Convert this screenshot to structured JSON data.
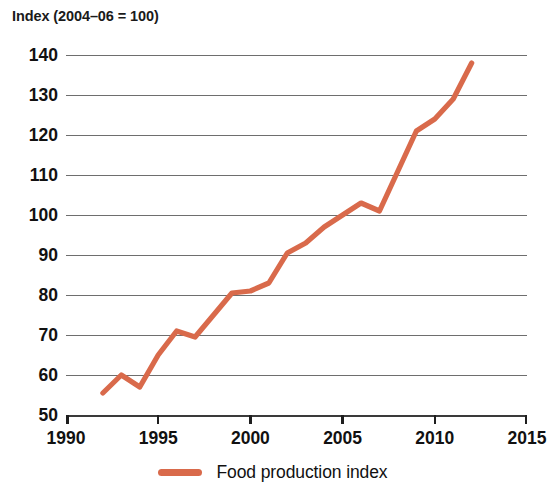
{
  "chart_data": {
    "type": "line",
    "title": "Index (2004–06 = 100)",
    "xlabel": "",
    "ylabel": "Index (2004–06 = 100)",
    "xlim": [
      1990,
      2015
    ],
    "ylim": [
      50,
      140
    ],
    "grid": true,
    "legend_position": "bottom-center",
    "xticks": [
      1990,
      1995,
      2000,
      2005,
      2010,
      2015
    ],
    "xtick_labels": [
      "1990",
      "1995",
      "2000",
      "2005",
      "2010",
      "2015"
    ],
    "yticks": [
      50,
      60,
      70,
      80,
      90,
      100,
      110,
      120,
      130,
      140
    ],
    "ytick_labels": [
      "50",
      "60",
      "70",
      "80",
      "90",
      "100",
      "110",
      "120",
      "130",
      "140"
    ],
    "series": [
      {
        "name": "Food production index",
        "color": "#d96a4b",
        "x": [
          1992,
          1993,
          1994,
          1995,
          1996,
          1997,
          1998,
          1999,
          2000,
          2001,
          2002,
          2003,
          2004,
          2005,
          2006,
          2007,
          2008,
          2009,
          2010,
          2011,
          2012
        ],
        "values": [
          55.5,
          60.0,
          57.0,
          65.0,
          71.0,
          69.5,
          75.0,
          80.5,
          81.0,
          83.0,
          90.5,
          93.0,
          97.0,
          100.0,
          103.0,
          101.0,
          111.0,
          121.0,
          124.0,
          129.0,
          138.0
        ]
      }
    ]
  },
  "legend": {
    "items": [
      {
        "label": "Food production index",
        "color": "#d96a4b"
      }
    ]
  }
}
